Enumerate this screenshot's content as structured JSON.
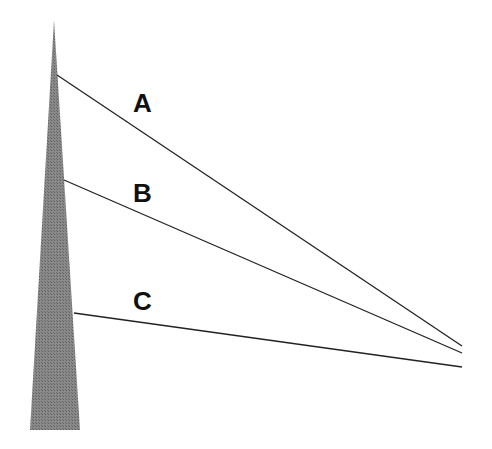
{
  "diagram": {
    "pole": {
      "tip": [
        54,
        20
      ],
      "base_left": [
        30,
        430
      ],
      "base_right": [
        80,
        430
      ],
      "color": "#7a7a7a"
    },
    "lines": [
      {
        "id": "A",
        "label": "A",
        "start": [
          57,
          75
        ],
        "end": [
          462,
          346
        ],
        "label_pos": [
          133,
          112
        ]
      },
      {
        "id": "B",
        "label": "B",
        "start": [
          64,
          180
        ],
        "end": [
          462,
          353
        ],
        "label_pos": [
          133,
          202
        ]
      },
      {
        "id": "C",
        "label": "C",
        "start": [
          74,
          313
        ],
        "end": [
          462,
          367
        ],
        "label_pos": [
          133,
          310
        ]
      }
    ],
    "line_color": "#222222"
  }
}
